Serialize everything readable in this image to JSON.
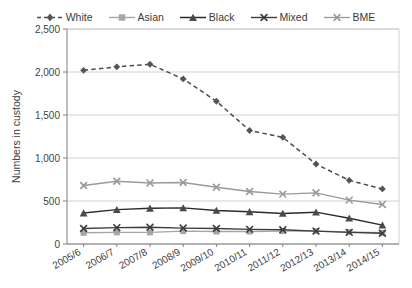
{
  "chart_data": {
    "type": "line",
    "title": "",
    "xlabel": "",
    "ylabel": "Numbers in custody",
    "ylim": [
      0,
      2500
    ],
    "ytick_labels": [
      "0",
      "500",
      "1,000",
      "1,500",
      "2,000",
      "2,500"
    ],
    "ytick_values": [
      0,
      500,
      1000,
      1500,
      2000,
      2500
    ],
    "grid": true,
    "legend_position": "top",
    "categories": [
      "2005/6",
      "2006/7",
      "2007/8",
      "2008/9",
      "2009/10",
      "2010/11",
      "2011/12",
      "2012/13",
      "2013/14",
      "2014/15"
    ],
    "series": [
      {
        "name": "White",
        "marker": "diamond",
        "dash": "dashed",
        "color": "#4d4d4d",
        "values": [
          2020,
          2060,
          2090,
          1920,
          1660,
          1320,
          1240,
          930,
          740,
          640
        ]
      },
      {
        "name": "Asian",
        "marker": "square",
        "dash": "solid",
        "color": "#a6a6a6",
        "values": [
          130,
          135,
          135,
          150,
          145,
          145,
          150,
          150,
          140,
          130
        ]
      },
      {
        "name": "Black",
        "marker": "triangle",
        "dash": "solid",
        "color": "#2b2b2b",
        "values": [
          360,
          400,
          415,
          420,
          390,
          375,
          355,
          370,
          300,
          220
        ]
      },
      {
        "name": "Mixed",
        "marker": "cross",
        "dash": "solid",
        "color": "#3d3d3d",
        "values": [
          180,
          190,
          195,
          185,
          180,
          170,
          165,
          150,
          135,
          125
        ]
      },
      {
        "name": "BME",
        "marker": "cross",
        "dash": "solid",
        "color": "#9a9a9a",
        "values": [
          680,
          730,
          710,
          715,
          660,
          610,
          580,
          595,
          510,
          460
        ]
      }
    ],
    "colors": {
      "gridline": "#cccccc",
      "axis": "#808080",
      "text": "#3f3f3f",
      "background": "#ffffff"
    }
  }
}
